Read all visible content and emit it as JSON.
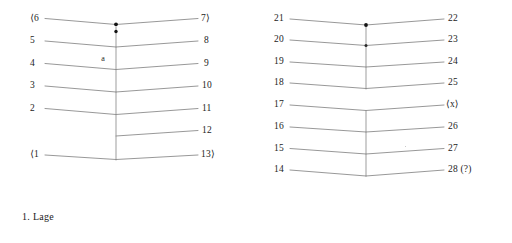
{
  "figure": {
    "background_color": "#ffffff",
    "line_color": "#8c8c8c",
    "text_color": "#1c1c1c",
    "vertex_dot_color": "#141414"
  },
  "panels": [
    {
      "id": "panel-1",
      "caption": "1.  Lage",
      "vertex_label": "a",
      "rows": [
        {
          "left": "⟨6",
          "right": "7⟩"
        },
        {
          "left": "5",
          "right": "8"
        },
        {
          "left": "4",
          "right": "9"
        },
        {
          "left": "3",
          "right": "10"
        },
        {
          "left": "2",
          "right": "11"
        },
        {
          "left": "",
          "right": "12"
        },
        {
          "left": "⟨1",
          "right": "13⟩"
        }
      ]
    },
    {
      "id": "panel-2",
      "caption": "2.  Lage",
      "vertex_label": "",
      "rows": [
        {
          "left": "21",
          "right": "22"
        },
        {
          "left": "20",
          "right": "23"
        },
        {
          "left": "19",
          "right": "24"
        },
        {
          "left": "18",
          "right": "25"
        },
        {
          "left": "17",
          "right": "⟨x⟩"
        },
        {
          "left": "16",
          "right": "26"
        },
        {
          "left": "15",
          "right": "27"
        },
        {
          "left": "14",
          "right": "28 (?)"
        }
      ]
    }
  ]
}
